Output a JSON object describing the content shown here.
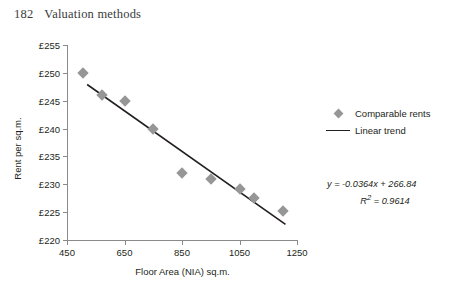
{
  "page": {
    "folio": "182",
    "running_head": "Valuation methods"
  },
  "chart_data": {
    "type": "scatter",
    "title": "",
    "xlabel": "Floor Area (NIA) sq.m.",
    "ylabel": "Rent per sq.m.",
    "xlim": [
      450,
      1250
    ],
    "ylim": [
      220,
      255
    ],
    "xticks": [
      450,
      650,
      850,
      1050,
      1250
    ],
    "xtick_labels": [
      "450",
      "650",
      "850",
      "1050",
      "1250"
    ],
    "yticks": [
      220,
      225,
      230,
      235,
      240,
      245,
      250,
      255
    ],
    "ytick_labels": [
      "£220",
      "£225",
      "£230",
      "£235",
      "£240",
      "£245",
      "£250",
      "£255"
    ],
    "grid": false,
    "legend_position": "right",
    "series": [
      {
        "name": "Comparable rents",
        "type": "scatter",
        "marker": "diamond",
        "color": "#969696",
        "points": [
          {
            "x": 505,
            "y": 250.0
          },
          {
            "x": 570,
            "y": 246.0
          },
          {
            "x": 650,
            "y": 245.0
          },
          {
            "x": 750,
            "y": 240.0
          },
          {
            "x": 850,
            "y": 232.0
          },
          {
            "x": 950,
            "y": 231.0
          },
          {
            "x": 1050,
            "y": 229.2
          },
          {
            "x": 1100,
            "y": 227.5
          },
          {
            "x": 1200,
            "y": 225.2
          }
        ]
      },
      {
        "name": "Linear trend",
        "type": "line",
        "color": "#231f20",
        "slope": -0.0364,
        "intercept": 266.84,
        "x_start": 520,
        "x_end": 1210
      }
    ],
    "annotations": {
      "equation": "y = -0.0364x + 266.84",
      "equation_y_var": "y",
      "equation_body": " = -0.0364x + 266.84",
      "r_squared_label": "R",
      "r_squared_sup": "2",
      "r_squared_value": " = 0.9614",
      "r_squared_full": "R2 = 0.9614"
    }
  },
  "legend": {
    "items": [
      {
        "label": "Comparable rents",
        "marker": "diamond",
        "color": "#969696"
      },
      {
        "label": "Linear trend",
        "marker": "line",
        "color": "#231f20"
      }
    ]
  },
  "colors": {
    "marker": "#969696",
    "trend_line": "#231f20",
    "axis": "#8a8a8a",
    "text": "#231f20",
    "background": "#ffffff"
  }
}
